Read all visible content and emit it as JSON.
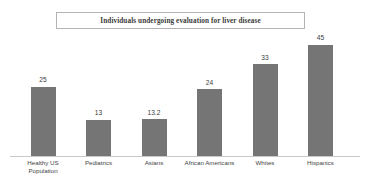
{
  "chart_data": {
    "type": "bar",
    "title": "Individuals undergoing evaluation for liver disease",
    "xlabel": "",
    "ylabel": "",
    "ylim": [
      0,
      45
    ],
    "grid": false,
    "legend": "none",
    "categories": [
      "Healthy US Population",
      "Pediatrics",
      "Asians",
      "African Americans",
      "Whites",
      "Hispanics"
    ],
    "values": [
      25,
      13,
      13.2,
      24,
      33,
      45
    ],
    "value_labels": [
      "25",
      "13",
      "13.2",
      "24",
      "33",
      "45"
    ],
    "bar_color": "#757575",
    "axis_color": "#c9c9c9",
    "title_border_color": "#b4b4b4"
  },
  "categories_display": [
    "Healthy US\nPopulation",
    "Pediatrics",
    "Asians",
    "African Americans",
    "Whites",
    "Hispanics"
  ]
}
